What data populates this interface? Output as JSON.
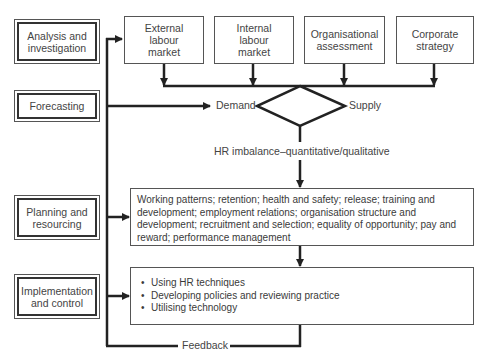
{
  "diagram": {
    "stages": [
      {
        "label": "Analysis and investigation"
      },
      {
        "label": "Forecasting"
      },
      {
        "label": "Planning and resourcing"
      },
      {
        "label": "Implementation and control"
      }
    ],
    "inputs": [
      {
        "label": "External labour market"
      },
      {
        "label": "Internal labour market"
      },
      {
        "label": "Organisational assessment"
      },
      {
        "label": "Corporate strategy"
      }
    ],
    "decision": {
      "left_label": "Demand",
      "right_label": "Supply"
    },
    "imbalance_label": "HR imbalance–quantitative/qualitative",
    "planning_text": "Working patterns; retention; health and safety; release; training and development; employment relations; organisation structure and development; recruitment and selection; equality of opportunity; pay and reward; performance management",
    "implementation_items": [
      "Using HR techniques",
      "Developing policies and reviewing practice",
      "Utilising technology"
    ],
    "feedback_label": "Feedback"
  }
}
